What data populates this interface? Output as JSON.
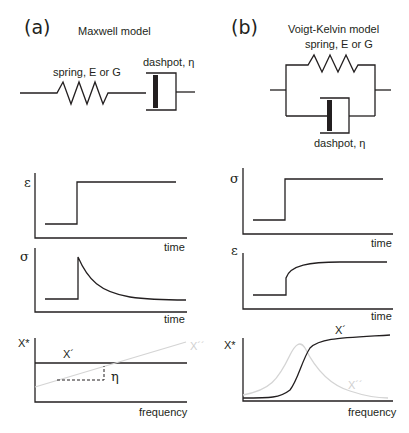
{
  "panels": {
    "a": {
      "label": "(a)",
      "title": "Maxwell model",
      "spring_label": "spring, E or G",
      "dashpot_label": "dashpot, η",
      "plot1": {
        "ylabel": "ε",
        "xlabel": "time"
      },
      "plot2": {
        "ylabel": "σ",
        "xlabel": "time"
      },
      "plot3": {
        "ylabel": "X*",
        "xlabel": "frequency",
        "curve_real": "X´",
        "curve_imag": "X´´",
        "slope_label": "η"
      }
    },
    "b": {
      "label": "(b)",
      "title": "Voigt-Kelvin model",
      "spring_label": "spring, E or G",
      "dashpot_label": "dashpot, η",
      "plot1": {
        "ylabel": "σ",
        "xlabel": "time"
      },
      "plot2": {
        "ylabel": "ε",
        "xlabel": "time"
      },
      "plot3": {
        "ylabel": "X*",
        "xlabel": "frequency",
        "curve_real": "X´",
        "curve_imag": "X´´"
      }
    }
  },
  "colors": {
    "ink": "#231f20",
    "light_curve": "#d4d4d4"
  }
}
